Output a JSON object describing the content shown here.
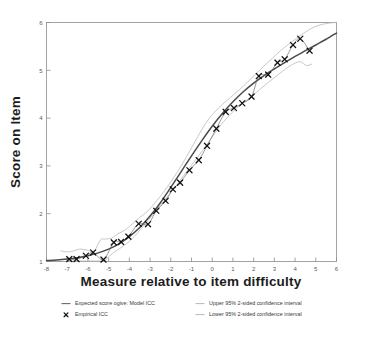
{
  "chart_data": {
    "type": "line",
    "title": "",
    "xlabel": "Measure relative to item difficulty",
    "ylabel": "Score on Item",
    "xlim": [
      -8,
      6
    ],
    "ylim": [
      1,
      6
    ],
    "xticks": [
      -8,
      -7,
      -6,
      -5,
      -4,
      -3,
      -2,
      -1,
      0,
      1,
      2,
      3,
      4,
      5,
      6
    ],
    "xticklabels": [
      "-8",
      "-7",
      "-6",
      "-5",
      "-4",
      "-3",
      "-2",
      "-1",
      "0",
      "1",
      "2",
      "3",
      "4",
      "5",
      "6"
    ],
    "yticks": [
      1,
      2,
      3,
      4,
      5,
      6
    ],
    "yticklabels": [
      "1",
      "2",
      "3",
      "4",
      "5",
      "6"
    ],
    "grid": false,
    "legend_position": "below",
    "series": [
      {
        "name": "Expected score ogive: Model ICC",
        "style": "line",
        "color": "#4a4a4a",
        "x": [
          -8.0,
          -7.5,
          -7.0,
          -6.5,
          -6.0,
          -5.5,
          -5.0,
          -4.5,
          -4.0,
          -3.5,
          -3.0,
          -2.5,
          -2.0,
          -1.5,
          -1.0,
          -0.5,
          0.0,
          0.5,
          1.0,
          1.5,
          2.0,
          2.5,
          3.0,
          3.5,
          4.0,
          4.5,
          5.0,
          5.5,
          6.0
        ],
        "y": [
          1.02,
          1.03,
          1.05,
          1.08,
          1.12,
          1.18,
          1.26,
          1.37,
          1.52,
          1.71,
          1.95,
          2.23,
          2.55,
          2.88,
          3.21,
          3.53,
          3.83,
          4.1,
          4.34,
          4.55,
          4.73,
          4.89,
          5.03,
          5.16,
          5.29,
          5.41,
          5.53,
          5.65,
          5.78
        ]
      },
      {
        "name": "Empirical ICC",
        "style": "markers",
        "marker": "x",
        "color": "#111111",
        "x": [
          -6.9,
          -6.55,
          -6.1,
          -5.75,
          -5.25,
          -4.75,
          -4.4,
          -4.05,
          -3.55,
          -3.1,
          -2.7,
          -2.25,
          -1.9,
          -1.55,
          -1.1,
          -0.65,
          -0.25,
          0.2,
          0.65,
          1.05,
          1.45,
          1.9,
          2.25,
          2.7,
          3.15,
          3.5,
          3.9,
          4.25,
          4.7
        ],
        "y": [
          1.05,
          1.05,
          1.12,
          1.19,
          1.04,
          1.4,
          1.41,
          1.52,
          1.79,
          1.78,
          2.06,
          2.27,
          2.51,
          2.65,
          2.91,
          3.12,
          3.42,
          3.78,
          4.13,
          4.21,
          4.31,
          4.45,
          4.88,
          4.91,
          5.16,
          5.23,
          5.53,
          5.66,
          5.41
        ]
      },
      {
        "name": "Upper 95% 2-sided confidence interval",
        "style": "line",
        "color": "#b5b5b5",
        "x": [
          -7.3,
          -7.0,
          -6.7,
          -6.4,
          -6.05,
          -5.7,
          -5.4,
          -5.15,
          -4.85,
          -4.55,
          -4.2,
          -3.85,
          -3.5,
          -3.1,
          -2.7,
          -2.3,
          -1.9,
          -1.5,
          -1.1,
          -0.7,
          -0.3,
          0.1,
          0.5,
          0.9,
          1.3,
          1.7,
          2.1,
          2.5,
          2.9,
          3.3,
          3.7,
          4.1,
          4.5,
          4.9,
          5.3,
          5.7,
          6.0
        ],
        "y": [
          1.22,
          1.2,
          1.22,
          1.26,
          1.24,
          1.22,
          1.45,
          1.47,
          1.49,
          1.58,
          1.66,
          1.79,
          1.92,
          2.06,
          2.26,
          2.48,
          2.73,
          3.0,
          3.3,
          3.61,
          3.9,
          4.12,
          4.29,
          4.44,
          4.59,
          4.75,
          4.92,
          5.09,
          5.25,
          5.41,
          5.55,
          5.68,
          5.8,
          5.9,
          5.96,
          5.99,
          6.0
        ]
      },
      {
        "name": "Lower 95% 2-sided confidence interval",
        "style": "line",
        "color": "#b5b5b5",
        "x": [
          -6.9,
          -6.55,
          -6.2,
          -5.85,
          -5.5,
          -5.2,
          -4.95,
          -4.65,
          -4.3,
          -3.95,
          -3.6,
          -3.25,
          -2.85,
          -2.45,
          -2.05,
          -1.65,
          -1.25,
          -0.85,
          -0.45,
          -0.05,
          0.35,
          0.75,
          1.15,
          1.55,
          1.95,
          2.35,
          2.75,
          3.15,
          3.55,
          3.95,
          4.25,
          4.55,
          4.8
        ],
        "y": [
          1.01,
          1.01,
          1.01,
          1.01,
          1.01,
          1.02,
          1.12,
          1.22,
          1.32,
          1.44,
          1.6,
          1.78,
          1.99,
          2.2,
          2.42,
          2.64,
          2.87,
          3.1,
          3.33,
          3.57,
          3.82,
          4.02,
          4.2,
          4.34,
          4.47,
          4.62,
          4.76,
          4.9,
          5.03,
          5.14,
          5.18,
          5.1,
          5.13
        ]
      }
    ]
  },
  "legend": {
    "items": [
      {
        "label": "Expected score ogive: Model ICC",
        "symbol": "line",
        "color": "#6a6a6a"
      },
      {
        "label": "Empirical ICC",
        "symbol": "marker",
        "color": "#111111"
      },
      {
        "label": "Upper 95% 2-sided confidence interval",
        "symbol": "line-light",
        "color": "#b0b0b0"
      },
      {
        "label": "Lower 95% 2-sided confidence interval",
        "symbol": "line-light",
        "color": "#b0b0b0"
      }
    ]
  }
}
